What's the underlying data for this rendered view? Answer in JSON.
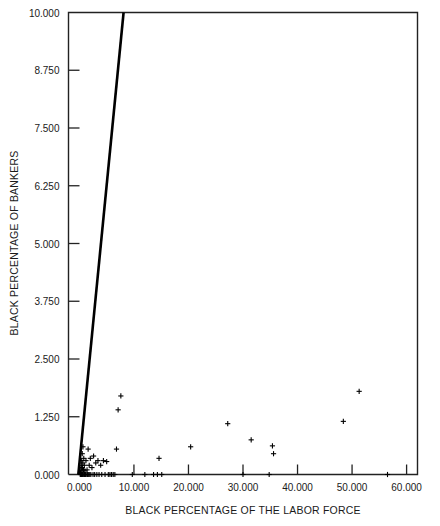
{
  "chart_data": {
    "type": "scatter",
    "title": "",
    "xlabel": "BLACK PERCENTAGE OF THE LABOR FORCE",
    "ylabel": "BLACK PERCENTAGE OF BANKERS",
    "xlim": [
      -2.0,
      62.0
    ],
    "ylim": [
      0.0,
      10.0
    ],
    "xticks": [
      0.0,
      10.0,
      20.0,
      30.0,
      40.0,
      50.0,
      60.0
    ],
    "xtick_labels": [
      "0.000",
      "10.000",
      "20.000",
      "30.000",
      "40.000",
      "50.000",
      "60.000"
    ],
    "yticks": [
      0.0,
      1.25,
      2.5,
      3.75,
      5.0,
      6.25,
      7.5,
      8.75,
      10.0
    ],
    "ytick_labels": [
      "0.000",
      "1.250",
      "2.500",
      "3.750",
      "5.000",
      "6.250",
      "7.500",
      "8.750",
      "10.000"
    ],
    "grid": false,
    "legend": null,
    "marker": "plus",
    "marker_color": "#000000",
    "line_color": "#000000",
    "reference_line": {
      "name": "equality-line",
      "label": "",
      "x": [
        -0.2,
        8.1
      ],
      "y": [
        0.0,
        10.0
      ]
    },
    "points": [
      {
        "x": 0.15,
        "y": 0.0
      },
      {
        "x": 0.2,
        "y": 0.05
      },
      {
        "x": 0.25,
        "y": 0.0
      },
      {
        "x": 0.3,
        "y": 0.12
      },
      {
        "x": 0.32,
        "y": 0.0
      },
      {
        "x": 0.35,
        "y": 0.2
      },
      {
        "x": 0.4,
        "y": 0.0
      },
      {
        "x": 0.42,
        "y": 0.3
      },
      {
        "x": 0.45,
        "y": 0.08
      },
      {
        "x": 0.5,
        "y": 0.0
      },
      {
        "x": 0.52,
        "y": 0.45
      },
      {
        "x": 0.55,
        "y": 0.15
      },
      {
        "x": 0.6,
        "y": 0.0
      },
      {
        "x": 0.62,
        "y": 0.25
      },
      {
        "x": 0.65,
        "y": 0.6
      },
      {
        "x": 0.7,
        "y": 0.0
      },
      {
        "x": 0.75,
        "y": 0.1
      },
      {
        "x": 0.8,
        "y": 0.35
      },
      {
        "x": 0.85,
        "y": 0.0
      },
      {
        "x": 0.9,
        "y": 0.2
      },
      {
        "x": 0.95,
        "y": 0.0
      },
      {
        "x": 1.0,
        "y": 0.08
      },
      {
        "x": 1.1,
        "y": 0.0
      },
      {
        "x": 1.2,
        "y": 0.3
      },
      {
        "x": 1.25,
        "y": 0.0
      },
      {
        "x": 1.4,
        "y": 0.1
      },
      {
        "x": 1.5,
        "y": 0.0
      },
      {
        "x": 1.6,
        "y": 0.55
      },
      {
        "x": 1.7,
        "y": 0.0
      },
      {
        "x": 1.8,
        "y": 0.2
      },
      {
        "x": 1.9,
        "y": 0.0
      },
      {
        "x": 2.0,
        "y": 0.35
      },
      {
        "x": 2.1,
        "y": 0.0
      },
      {
        "x": 2.3,
        "y": 0.15
      },
      {
        "x": 2.5,
        "y": 0.0
      },
      {
        "x": 2.6,
        "y": 0.4
      },
      {
        "x": 2.8,
        "y": 0.0
      },
      {
        "x": 3.0,
        "y": 0.25
      },
      {
        "x": 3.2,
        "y": 0.0
      },
      {
        "x": 3.4,
        "y": 0.3
      },
      {
        "x": 3.6,
        "y": 0.0
      },
      {
        "x": 3.9,
        "y": 0.2
      },
      {
        "x": 4.1,
        "y": 0.0
      },
      {
        "x": 4.4,
        "y": 0.3
      },
      {
        "x": 4.7,
        "y": 0.0
      },
      {
        "x": 5.0,
        "y": 0.28
      },
      {
        "x": 5.3,
        "y": 0.0
      },
      {
        "x": 5.6,
        "y": 0.0
      },
      {
        "x": 5.9,
        "y": 0.0
      },
      {
        "x": 6.2,
        "y": 0.0
      },
      {
        "x": 6.5,
        "y": 0.0
      },
      {
        "x": 6.8,
        "y": 0.55
      },
      {
        "x": 7.1,
        "y": 1.4
      },
      {
        "x": 7.6,
        "y": 1.7
      },
      {
        "x": 9.7,
        "y": 0.0
      },
      {
        "x": 12.0,
        "y": 0.0
      },
      {
        "x": 13.6,
        "y": 0.0
      },
      {
        "x": 14.3,
        "y": 0.0
      },
      {
        "x": 14.6,
        "y": 0.35
      },
      {
        "x": 15.1,
        "y": 0.0
      },
      {
        "x": 20.4,
        "y": 0.6
      },
      {
        "x": 27.2,
        "y": 1.1
      },
      {
        "x": 30.0,
        "y": 0.0
      },
      {
        "x": 31.5,
        "y": 0.75
      },
      {
        "x": 34.8,
        "y": 0.0
      },
      {
        "x": 35.4,
        "y": 0.62
      },
      {
        "x": 35.6,
        "y": 0.45
      },
      {
        "x": 48.4,
        "y": 1.15
      },
      {
        "x": 51.3,
        "y": 1.8
      },
      {
        "x": 56.5,
        "y": 0.0
      }
    ]
  },
  "figure": {
    "background_color": "#ffffff",
    "axis_color": "#222222"
  }
}
